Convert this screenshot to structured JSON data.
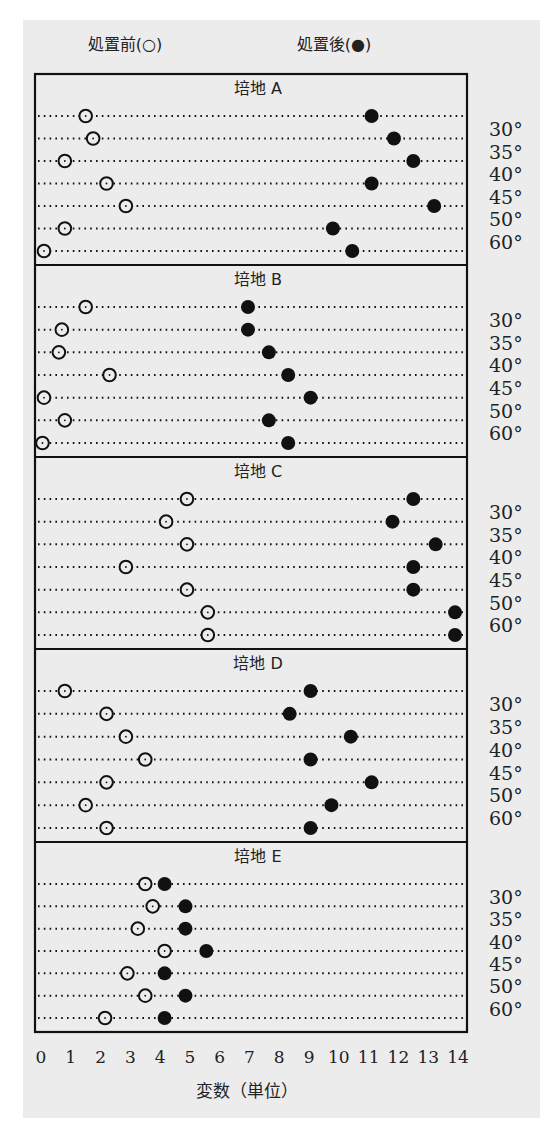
{
  "chart_data": {
    "type": "scatter",
    "subtype": "dot-plot",
    "legend": {
      "before": "処置前(○)",
      "after": "処置後(●)",
      "placement": "top"
    },
    "xlabel": "変数（単位）",
    "xlim": [
      0,
      14
    ],
    "x_ticks": [
      "0",
      "1",
      "2",
      "3",
      "4",
      "5",
      "6",
      "7",
      "8",
      "9",
      "10",
      "11",
      "12",
      "13",
      "14"
    ],
    "row_labels": [
      "30°",
      "35°",
      "40°",
      "45°",
      "50°",
      "60°"
    ],
    "grid": "dotted horizontal rows",
    "panels": [
      {
        "title": "培地 A",
        "before": [
          1.5,
          1.75,
          0.8,
          2.2,
          2.85,
          0.8,
          0.1
        ],
        "after": [
          11.1,
          11.85,
          12.5,
          11.1,
          13.2,
          9.8,
          10.45
        ]
      },
      {
        "title": "培地 B",
        "before": [
          1.5,
          0.7,
          0.6,
          2.3,
          0.1,
          0.8,
          0.05
        ],
        "after": [
          6.95,
          6.95,
          7.65,
          8.3,
          9.05,
          7.65,
          8.3
        ]
      },
      {
        "title": "培地 C",
        "before": [
          4.9,
          4.2,
          4.9,
          2.85,
          4.9,
          5.6,
          5.6
        ],
        "after": [
          12.5,
          11.8,
          13.25,
          12.5,
          12.5,
          13.9,
          13.9
        ]
      },
      {
        "title": "培地 D",
        "before": [
          0.8,
          2.2,
          2.85,
          3.5,
          2.2,
          1.5,
          2.2
        ],
        "after": [
          9.05,
          8.35,
          10.4,
          9.05,
          11.1,
          9.75,
          9.05
        ]
      },
      {
        "title": "培地 E",
        "before": [
          3.5,
          3.75,
          3.25,
          4.15,
          2.9,
          3.5,
          2.15
        ],
        "after": [
          4.15,
          4.85,
          4.85,
          5.55,
          4.15,
          4.85,
          4.15
        ]
      }
    ]
  },
  "colors": {
    "background": "#ececec",
    "ink": "#111111"
  }
}
